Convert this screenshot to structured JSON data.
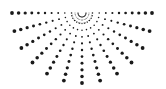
{
  "graphic": {
    "name": "dotted-half-sunburst",
    "color": "#1a1a1a",
    "background": "#ffffff",
    "center": [
      82,
      13
    ],
    "ray_angles_deg": [
      180,
      165,
      150,
      135,
      120,
      105,
      90,
      75,
      60,
      45,
      30,
      15,
      0
    ],
    "dots_per_ray": 11,
    "inner_radius": 4,
    "outer_radius": 70,
    "min_dot_radius": 0.5,
    "max_dot_radius": 1.9,
    "inner_arcs": [
      4,
      7,
      10
    ]
  }
}
